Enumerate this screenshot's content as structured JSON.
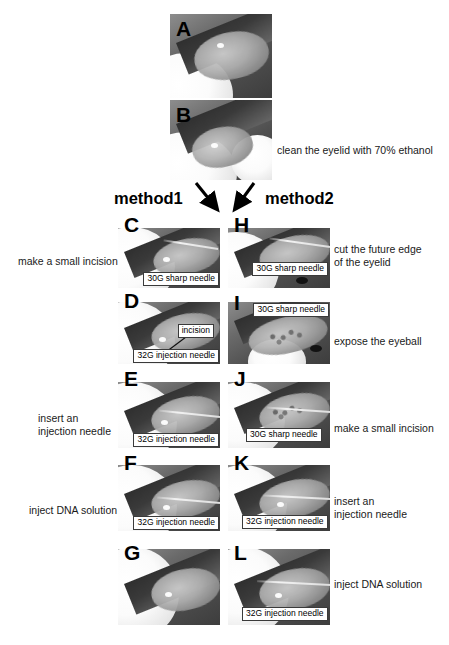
{
  "figure": {
    "type": "surgical-protocol-photo-figure",
    "branch_labels": {
      "method1": "method1",
      "method2": "method2"
    },
    "panels": [
      {
        "id": "A",
        "letter": "A",
        "caption": "",
        "caption_side": "none",
        "annotations": []
      },
      {
        "id": "B",
        "letter": "B",
        "caption": "clean the eyelid with 70% ethanol",
        "caption_side": "right",
        "annotations": []
      },
      {
        "id": "C",
        "letter": "C",
        "column": "method1",
        "caption": "make a small incision",
        "caption_side": "left",
        "annotations": [
          {
            "text": "30G sharp needle",
            "position": "bottom-right"
          }
        ]
      },
      {
        "id": "D",
        "letter": "D",
        "column": "method1",
        "caption": "",
        "caption_side": "none",
        "annotations": [
          {
            "text": "incision",
            "position": "mid-right"
          },
          {
            "text": "32G injection needle",
            "position": "bottom-right"
          }
        ]
      },
      {
        "id": "E",
        "letter": "E",
        "column": "method1",
        "caption": "insert an\ninjection needle",
        "caption_side": "left",
        "annotations": [
          {
            "text": "32G injection needle",
            "position": "bottom-right"
          }
        ]
      },
      {
        "id": "F",
        "letter": "F",
        "column": "method1",
        "caption": "inject DNA solution",
        "caption_side": "left",
        "annotations": [
          {
            "text": "32G injection needle",
            "position": "bottom-right"
          }
        ]
      },
      {
        "id": "G",
        "letter": "G",
        "column": "method1",
        "caption": "",
        "caption_side": "none",
        "annotations": []
      },
      {
        "id": "H",
        "letter": "H",
        "column": "method2",
        "caption": "cut the future edge\nof the eyelid",
        "caption_side": "right",
        "annotations": [
          {
            "text": "30G sharp needle",
            "position": "mid-right"
          }
        ]
      },
      {
        "id": "I",
        "letter": "I",
        "column": "method2",
        "caption": "expose the eyeball",
        "caption_side": "right",
        "annotations": [
          {
            "text": "30G sharp needle",
            "position": "top-right"
          }
        ]
      },
      {
        "id": "J",
        "letter": "J",
        "column": "method2",
        "caption": "make a small incision",
        "caption_side": "right",
        "annotations": [
          {
            "text": "30G sharp needle",
            "position": "bottom-left"
          }
        ]
      },
      {
        "id": "K",
        "letter": "K",
        "column": "method2",
        "caption": "insert an\ninjection needle",
        "caption_side": "right",
        "annotations": [
          {
            "text": "32G injection needle",
            "position": "bottom-left"
          }
        ]
      },
      {
        "id": "L",
        "letter": "L",
        "column": "method2",
        "caption": "inject DNA solution",
        "caption_side": "right",
        "annotations": [
          {
            "text": "32G injection needle",
            "position": "bottom-left"
          }
        ]
      }
    ],
    "colors": {
      "background": "#ffffff",
      "text": "#1a1a1a",
      "letter": "#000000",
      "box_border": "#3a3a3a",
      "box_fill": "#ffffff",
      "arrow": "#000000"
    }
  }
}
